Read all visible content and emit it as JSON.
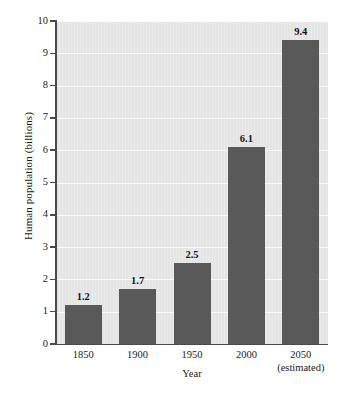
{
  "chart_data": {
    "type": "bar",
    "title": "",
    "xlabel": "Year",
    "ylabel": "Human population (billions)",
    "categories": [
      "1850",
      "1900",
      "1950",
      "2000",
      "2050"
    ],
    "category_sublabels": [
      "",
      "",
      "",
      "",
      "(estimated)"
    ],
    "values": [
      1.2,
      1.7,
      2.5,
      6.1,
      9.4
    ],
    "value_labels": [
      "1.2",
      "1.7",
      "2.5",
      "6.1",
      "9.4"
    ],
    "ylim": [
      0,
      10
    ],
    "ytick_labels": [
      "0",
      "1",
      "2",
      "3",
      "4",
      "5",
      "6",
      "7",
      "8",
      "9",
      "10"
    ],
    "grid": true,
    "legend": "none",
    "colors": {
      "bar": "#595959",
      "plot_background": "#e9e9e9",
      "axis": "#4a4a4a",
      "gridline": "#ffffff",
      "text": "#1a1a1a",
      "canvas": "#ffffff"
    }
  }
}
